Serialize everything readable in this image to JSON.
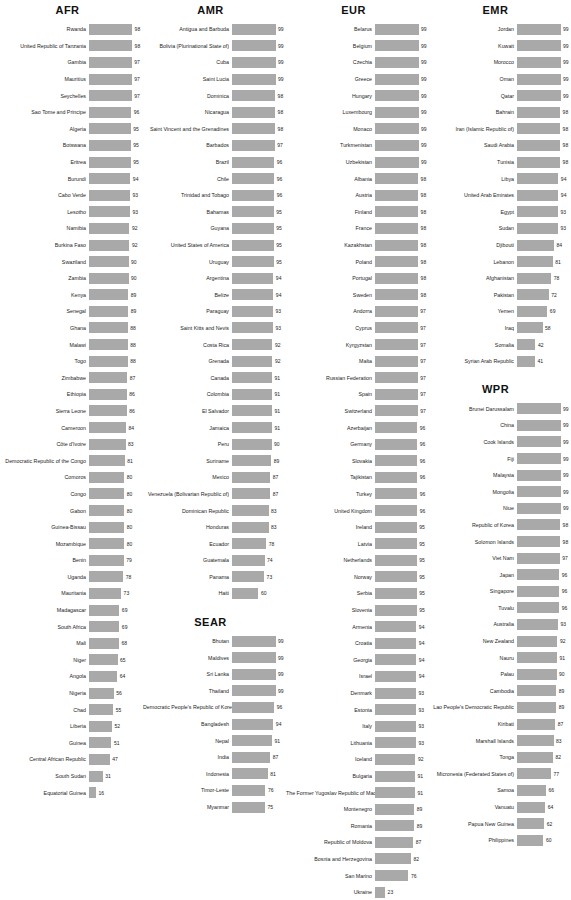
{
  "chart_data": {
    "type": "bar",
    "title": "",
    "xlabel": "",
    "ylabel": "",
    "xlim": [
      0,
      100
    ],
    "grid": false,
    "legend": "none",
    "orientation": "horizontal",
    "bar_color": "#a9a9a9",
    "value_suffix": "",
    "groups": [
      {
        "name": "AFR",
        "categories": [
          "Rwanda",
          "United Republic of Tanzania",
          "Gambia",
          "Mauritius",
          "Seychelles",
          "Sao Tome and Principe",
          "Algeria",
          "Botswana",
          "Eritrea",
          "Burundi",
          "Cabo Verde",
          "Lesotho",
          "Namibia",
          "Burkina Faso",
          "Swaziland",
          "Zambia",
          "Kenya",
          "Senegal",
          "Ghana",
          "Malawi",
          "Togo",
          "Zimbabwe",
          "Ethiopia",
          "Sierra Leone",
          "Cameroon",
          "Côte d'Ivoire",
          "Democratic Republic of the Congo",
          "Comoros",
          "Congo",
          "Gabon",
          "Guinea-Bissau",
          "Mozambique",
          "Benin",
          "Uganda",
          "Mauritania",
          "Madagascar",
          "South Africa",
          "Mali",
          "Niger",
          "Angola",
          "Nigeria",
          "Chad",
          "Liberia",
          "Guinea",
          "Central African Republic",
          "South Sudan",
          "Equatorial Guinea"
        ],
        "values": [
          98,
          98,
          97,
          97,
          97,
          96,
          95,
          95,
          95,
          94,
          93,
          93,
          92,
          92,
          90,
          90,
          89,
          89,
          88,
          88,
          88,
          87,
          86,
          86,
          84,
          83,
          81,
          80,
          80,
          80,
          80,
          80,
          79,
          78,
          73,
          69,
          69,
          68,
          65,
          64,
          56,
          55,
          52,
          51,
          47,
          31,
          16
        ]
      },
      {
        "name": "AMR",
        "categories": [
          "Antigua and Barbuda",
          "Bolivia (Plurinational State of)",
          "Cuba",
          "Saint Lucia",
          "Dominica",
          "Nicaragua",
          "Saint Vincent and the Grenadines",
          "Barbados",
          "Brazil",
          "Chile",
          "Trinidad and Tobago",
          "Bahamas",
          "Guyana",
          "United States of America",
          "Uruguay",
          "Argentina",
          "Belize",
          "Paraguay",
          "Saint Kitts and Nevis",
          "Costa Rica",
          "Grenada",
          "Canada",
          "Colombia",
          "El Salvador",
          "Jamaica",
          "Peru",
          "Suriname",
          "Mexico",
          "Venezuela (Bolivarian Republic of)",
          "Dominican Republic",
          "Honduras",
          "Ecuador",
          "Guatemala",
          "Panama",
          "Haiti"
        ],
        "values": [
          99,
          99,
          99,
          99,
          98,
          98,
          98,
          97,
          96,
          96,
          96,
          95,
          95,
          95,
          95,
          94,
          94,
          93,
          93,
          92,
          92,
          91,
          91,
          91,
          91,
          90,
          89,
          87,
          87,
          83,
          83,
          78,
          74,
          73,
          60
        ]
      },
      {
        "name": "SEAR",
        "categories": [
          "Bhutan",
          "Maldives",
          "Sri Lanka",
          "Thailand",
          "Democratic People's Republic of Korea",
          "Bangladesh",
          "Nepal",
          "India",
          "Indonesia",
          "Timor-Leste",
          "Myanmar"
        ],
        "values": [
          99,
          99,
          99,
          99,
          96,
          94,
          91,
          87,
          81,
          76,
          75
        ]
      },
      {
        "name": "EUR",
        "categories": [
          "Belarus",
          "Belgium",
          "Czechia",
          "Greece",
          "Hungary",
          "Luxembourg",
          "Monaco",
          "Turkmenistan",
          "Uzbekistan",
          "Albania",
          "Austria",
          "Finland",
          "France",
          "Kazakhstan",
          "Poland",
          "Portugal",
          "Sweden",
          "Andorra",
          "Cyprus",
          "Kyrgyzstan",
          "Malta",
          "Russian Federation",
          "Spain",
          "Switzerland",
          "Azerbaijan",
          "Germany",
          "Slovakia",
          "Tajikistan",
          "Turkey",
          "United Kingdom",
          "Ireland",
          "Latvia",
          "Netherlands",
          "Norway",
          "Serbia",
          "Slovenia",
          "Armenia",
          "Croatia",
          "Georgia",
          "Israel",
          "Denmark",
          "Estonia",
          "Italy",
          "Lithuania",
          "Iceland",
          "Bulgaria",
          "The Former Yugoslav Republic of Macedonia",
          "Montenegro",
          "Romania",
          "Republic of Moldova",
          "Bosnia and Herzegovina",
          "San Marino",
          "Ukraine"
        ],
        "values": [
          99,
          99,
          99,
          99,
          99,
          99,
          99,
          99,
          99,
          98,
          98,
          98,
          98,
          98,
          98,
          98,
          98,
          97,
          97,
          97,
          97,
          97,
          97,
          97,
          96,
          96,
          96,
          96,
          96,
          96,
          95,
          95,
          95,
          95,
          95,
          95,
          94,
          94,
          94,
          94,
          93,
          93,
          93,
          93,
          92,
          91,
          91,
          89,
          89,
          87,
          82,
          76,
          23
        ]
      },
      {
        "name": "EMR",
        "categories": [
          "Jordan",
          "Kuwait",
          "Morocco",
          "Oman",
          "Qatar",
          "Bahrain",
          "Iran (Islamic Republic of)",
          "Saudi Arabia",
          "Tunisia",
          "Libya",
          "United Arab Emirates",
          "Egypt",
          "Sudan",
          "Djibouti",
          "Lebanon",
          "Afghanistan",
          "Pakistan",
          "Yemen",
          "Iraq",
          "Somalia",
          "Syrian Arab Republic"
        ],
        "values": [
          99,
          99,
          99,
          99,
          99,
          98,
          98,
          98,
          98,
          94,
          94,
          93,
          93,
          84,
          81,
          78,
          72,
          69,
          58,
          42,
          41
        ]
      },
      {
        "name": "WPR",
        "categories": [
          "Brunei Darussalam",
          "China",
          "Cook Islands",
          "Fiji",
          "Malaysia",
          "Mongolia",
          "Niue",
          "Republic of Korea",
          "Solomon Islands",
          "Viet Nam",
          "Japan",
          "Singapore",
          "Tuvalu",
          "Australia",
          "New Zealand",
          "Nauru",
          "Palau",
          "Cambodia",
          "Lao People's Democratic Republic",
          "Kiribati",
          "Marshall Islands",
          "Tonga",
          "Micronesia (Federated States of)",
          "Samoa",
          "Vanuatu",
          "Papua New Guinea",
          "Philippines"
        ],
        "values": [
          99,
          99,
          99,
          99,
          99,
          99,
          99,
          98,
          98,
          97,
          96,
          96,
          96,
          93,
          92,
          91,
          90,
          89,
          89,
          87,
          83,
          82,
          77,
          66,
          64,
          62,
          60
        ]
      }
    ]
  },
  "layout": {
    "columns": [
      [
        "AFR"
      ],
      [
        "AMR",
        "SEAR"
      ],
      [
        "EUR"
      ],
      [
        "EMR",
        "WPR"
      ]
    ]
  }
}
